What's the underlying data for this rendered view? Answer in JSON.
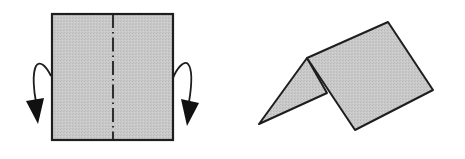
{
  "diagram": {
    "type": "origami-fold-instruction",
    "colors": {
      "background": "#ffffff",
      "paper_fill": "#c8c8c8",
      "stroke": "#1e1e1e"
    },
    "step1": {
      "description": "Square paper with vertical mountain-fold line; both sides folded back/down",
      "icons": [
        "fold-arrow-left-icon",
        "fold-arrow-right-icon",
        "mountain-fold-line"
      ]
    },
    "step2": {
      "description": "Paper folded in half forming a tent shape"
    }
  }
}
